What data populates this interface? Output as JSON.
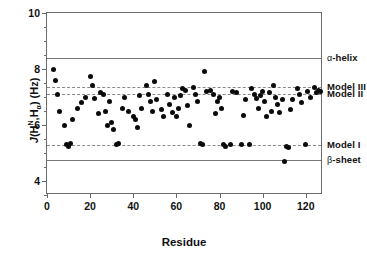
{
  "chart_data": {
    "type": "scatter",
    "title": "",
    "xlabel": "Residue",
    "ylabel": "J(Hᴺ,Hα) (Hz)",
    "ylabel_parts": {
      "j": "J",
      "open": "(H",
      "sup1": "N",
      "comma": ",H",
      "sub1": "α",
      "close": ") (Hz)"
    },
    "xlim": [
      0,
      128
    ],
    "ylim": [
      3.5,
      10
    ],
    "xticks": [
      0,
      20,
      40,
      60,
      80,
      100,
      120
    ],
    "xticklabels": [
      "0",
      "20",
      "40",
      "60",
      "80",
      "100",
      "120"
    ],
    "yticks": [
      4,
      6,
      8,
      10
    ],
    "yticklabels": [
      "4",
      "6",
      "8",
      "10"
    ],
    "yminorticks": [
      3.5,
      4.5,
      5,
      5.5,
      6.5,
      7,
      7.5,
      8.5,
      9,
      9.5
    ],
    "grid": false,
    "legend": "right-outside-annotations",
    "marker": "filled-circle",
    "marker_color": "#0a0a0a",
    "series": [
      {
        "name": "J(HN,Ha) coupling",
        "x": [
          3,
          4,
          5,
          6,
          8,
          9,
          10,
          11,
          12,
          14,
          16,
          18,
          20,
          21,
          22,
          24,
          25,
          26,
          27,
          28,
          29,
          30,
          31,
          32,
          33,
          35,
          36,
          38,
          40,
          41,
          42,
          43,
          44,
          46,
          47,
          48,
          49,
          50,
          51,
          53,
          54,
          56,
          57,
          58,
          59,
          60,
          61,
          62,
          63,
          64,
          65,
          66,
          68,
          69,
          70,
          71,
          72,
          73,
          74,
          76,
          77,
          78,
          79,
          80,
          81,
          82,
          83,
          85,
          86,
          88,
          90,
          91,
          92,
          94,
          95,
          96,
          97,
          98,
          99,
          100,
          101,
          102,
          103,
          104,
          105,
          106,
          107,
          108,
          109,
          110,
          111,
          112,
          113,
          114,
          116,
          117,
          118,
          120,
          121,
          122,
          124,
          125,
          126,
          127
        ],
        "y": [
          8.0,
          7.6,
          7.1,
          6.5,
          6.0,
          5.3,
          5.25,
          5.35,
          6.2,
          6.6,
          6.8,
          7.0,
          7.75,
          7.4,
          6.95,
          6.4,
          7.15,
          7.1,
          6.5,
          6.0,
          6.85,
          6.1,
          5.85,
          5.3,
          5.35,
          6.6,
          7.0,
          6.5,
          6.3,
          6.2,
          5.9,
          7.05,
          6.6,
          7.4,
          7.1,
          6.85,
          6.5,
          7.55,
          6.9,
          6.55,
          6.3,
          7.1,
          6.75,
          6.45,
          7.0,
          6.3,
          6.6,
          7.05,
          7.3,
          7.25,
          6.7,
          6.0,
          7.35,
          7.1,
          6.85,
          5.35,
          5.3,
          7.9,
          7.2,
          7.25,
          7.1,
          6.4,
          6.85,
          7.0,
          6.6,
          5.3,
          5.25,
          5.3,
          7.2,
          7.15,
          5.3,
          6.35,
          6.9,
          5.3,
          7.3,
          7.1,
          6.95,
          6.6,
          7.05,
          7.2,
          6.85,
          6.3,
          7.15,
          6.5,
          7.4,
          7.0,
          6.75,
          6.45,
          6.9,
          4.7,
          5.25,
          5.2,
          6.55,
          6.9,
          7.3,
          7.1,
          6.8,
          5.3,
          7.2,
          7.0,
          7.35,
          7.15,
          7.25,
          7.2
        ]
      }
    ],
    "reference_lines": [
      {
        "id": "alpha-helix",
        "label": "α -helix",
        "label_greek": "α",
        "label_rest": "-helix",
        "value": 8.4,
        "style": "solid",
        "color": "#777777"
      },
      {
        "id": "model-iii",
        "label": "Model III",
        "value": 7.35,
        "style": "dashed",
        "color": "#8a8a8a"
      },
      {
        "id": "model-ii",
        "label": "Model II",
        "value": 7.1,
        "style": "dashed",
        "color": "#8a8a8a"
      },
      {
        "id": "model-i",
        "label": "Model I",
        "value": 5.27,
        "style": "dashed",
        "color": "#8a8a8a"
      },
      {
        "id": "beta-sheet",
        "label": "β -sheet",
        "label_greek": "β",
        "label_rest": "-sheet",
        "value": 4.75,
        "style": "solid",
        "color": "#777777"
      }
    ]
  }
}
